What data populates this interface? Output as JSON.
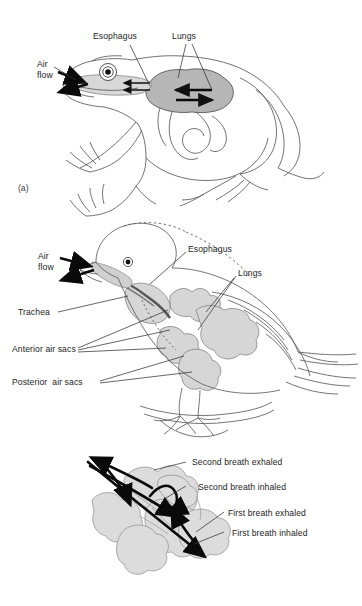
{
  "figure": {
    "background_color": "#ffffff",
    "ink_color": "#1c1c1c",
    "organ_fill_dark": "#b6b6b6",
    "organ_fill_light": "#dcdcdc",
    "outline_color": "#6a6a6a"
  },
  "panel_a": {
    "marker": "(a)",
    "subject": "frog",
    "labels": {
      "air_flow": "Air\nflow",
      "esophagus": "Esophagus",
      "lungs": "Lungs"
    },
    "arrows": {
      "inhale": "air-flow-in-arrow",
      "exhale": "air-flow-out-arrow",
      "buccal_arrow_1": "buccal-arrow-left",
      "buccal_arrow_2": "buccal-arrow-left",
      "lung_arrow_in": "lung-arrow-left",
      "lung_arrow_out": "lung-arrow-right"
    }
  },
  "panel_b": {
    "marker": "(b)",
    "subject": "bird",
    "labels": {
      "air_flow": "Air\nflow",
      "esophagus": "Esophagus",
      "lungs": "Lungs",
      "trachea": "Trachea",
      "anterior_air_sacs": "Anterior air sacs",
      "posterior_air_sacs": "Posterior  air sacs"
    }
  },
  "panel_c": {
    "subject": "bird air sac airflow detail",
    "labels": {
      "second_exhaled": "Second breath exhaled",
      "second_inhaled": "Second breath inhaled",
      "first_exhaled": "First breath exhaled",
      "first_inhaled": "First breath inhaled"
    }
  }
}
